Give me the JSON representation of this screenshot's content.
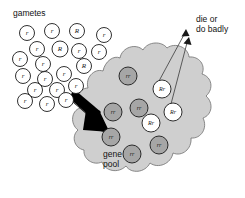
{
  "figure": {
    "title_label": "gametes",
    "outcome_label": "die or\ndo badly",
    "pool_label": "gene\npool",
    "colors": {
      "background": "#ffffff",
      "pool_fill": "#cfcfcf",
      "pool_stroke": "#6e6e6e",
      "homozygous_fill": "#a6a6a6",
      "heterozygous_fill": "#ffffff",
      "ink": "#1a1a1a",
      "arrow_fill": "#000000"
    }
  },
  "gametes": {
    "label": "gametes",
    "count": 20,
    "items": [
      {
        "genotype": "r",
        "cx": 27,
        "cy": 33,
        "r": 7.5
      },
      {
        "genotype": "r",
        "cx": 52,
        "cy": 31,
        "r": 7.5
      },
      {
        "genotype": "R",
        "cx": 77,
        "cy": 31,
        "r": 7.5
      },
      {
        "genotype": "r",
        "cx": 104,
        "cy": 35,
        "r": 7.5
      },
      {
        "genotype": "r",
        "cx": 37,
        "cy": 49,
        "r": 7.5
      },
      {
        "genotype": "R",
        "cx": 60,
        "cy": 49,
        "r": 8.0
      },
      {
        "genotype": "r",
        "cx": 79,
        "cy": 51,
        "r": 7.5
      },
      {
        "genotype": "r",
        "cx": 99,
        "cy": 52,
        "r": 7.5
      },
      {
        "genotype": "r",
        "cx": 20,
        "cy": 59,
        "r": 7.5
      },
      {
        "genotype": "r",
        "cx": 43,
        "cy": 64,
        "r": 7.5
      },
      {
        "genotype": "R",
        "cx": 84,
        "cy": 66,
        "r": 7.5
      },
      {
        "genotype": "r",
        "cx": 23,
        "cy": 76,
        "r": 7.5
      },
      {
        "genotype": "r",
        "cx": 45,
        "cy": 79,
        "r": 7.5
      },
      {
        "genotype": "r",
        "cx": 64,
        "cy": 74,
        "r": 7.5
      },
      {
        "genotype": "r",
        "cx": 35,
        "cy": 90,
        "r": 7.5
      },
      {
        "genotype": "r",
        "cx": 57,
        "cy": 90,
        "r": 7.5
      },
      {
        "genotype": "r",
        "cx": 76,
        "cy": 86,
        "r": 7.5
      },
      {
        "genotype": "r",
        "cx": 25,
        "cy": 101,
        "r": 7.5
      },
      {
        "genotype": "r",
        "cx": 47,
        "cy": 104,
        "r": 7.5
      },
      {
        "genotype": "r",
        "cx": 66,
        "cy": 100,
        "r": 7.5
      }
    ]
  },
  "gene_pool": {
    "label": "gene\npool",
    "organisms": [
      {
        "genotype": "rr",
        "type": "homozygous",
        "cx": 128,
        "cy": 76,
        "r": 9
      },
      {
        "genotype": "rr",
        "type": "homozygous",
        "cx": 139,
        "cy": 108,
        "r": 9
      },
      {
        "genotype": "rr",
        "type": "homozygous",
        "cx": 113,
        "cy": 112,
        "r": 9
      },
      {
        "genotype": "rr",
        "type": "homozygous",
        "cx": 111,
        "cy": 137,
        "r": 9
      },
      {
        "genotype": "rr",
        "type": "homozygous",
        "cx": 132,
        "cy": 154,
        "r": 9
      },
      {
        "genotype": "rr",
        "type": "homozygous",
        "cx": 159,
        "cy": 145,
        "r": 9
      },
      {
        "genotype": "Rr",
        "type": "heterozygous",
        "cx": 162,
        "cy": 89,
        "r": 9
      },
      {
        "genotype": "Rr",
        "type": "heterozygous",
        "cx": 151,
        "cy": 123,
        "r": 9
      },
      {
        "genotype": "Rr",
        "type": "heterozygous",
        "cx": 173,
        "cy": 112,
        "r": 9
      }
    ]
  },
  "annotations": {
    "outcome_text_line1": "die or",
    "outcome_text_line2": "do badly",
    "pool_text_line1": "gene",
    "pool_text_line2": "pool",
    "big_arrow_name": "gametes-enter-pool-arrow",
    "thin_arrow_count": 2
  }
}
